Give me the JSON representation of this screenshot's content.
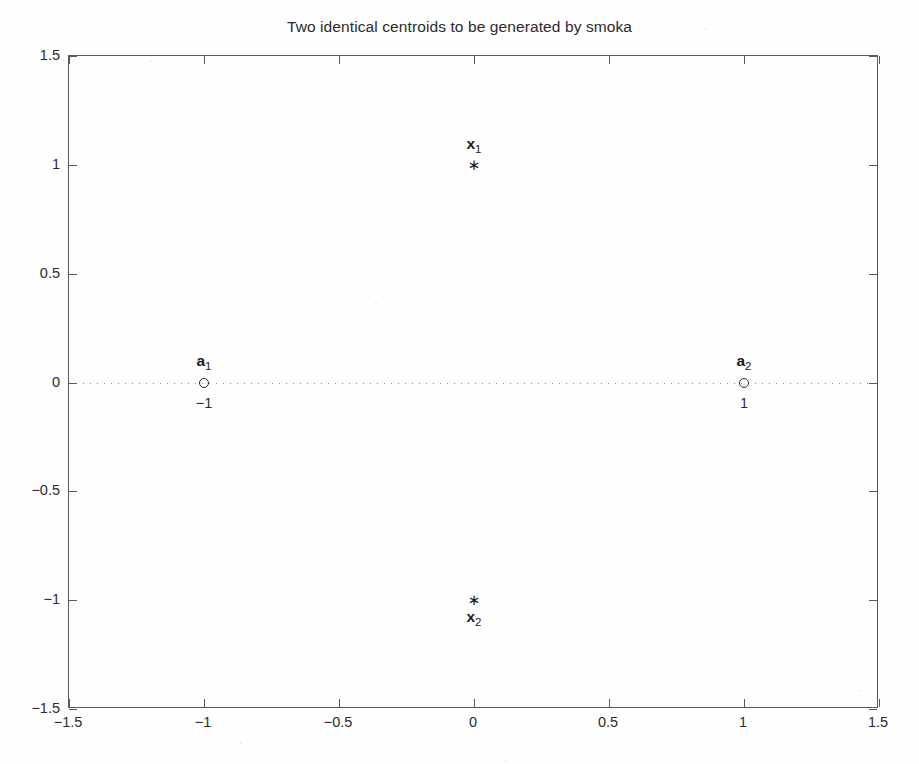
{
  "chart_data": {
    "type": "scatter",
    "title": "Two identical centroids to be generated by smoka",
    "xlabel": "",
    "ylabel": "",
    "xlim": [
      -1.5,
      1.5
    ],
    "ylim": [
      -1.5,
      1.5
    ],
    "grid": false,
    "legend": "none",
    "xticks": [
      -1.5,
      -1,
      -0.5,
      0,
      0.5,
      1,
      1.5
    ],
    "xticklabels": [
      "-1.5",
      "-1",
      "-0.5",
      "0",
      "0.5",
      "1",
      "1.5"
    ],
    "yticks": [
      -1.5,
      -1,
      -0.5,
      0,
      0.5,
      1,
      1.5
    ],
    "yticklabels": [
      "-1.5",
      "-1",
      "-0.5",
      "0",
      "0.5",
      "1",
      "1.5"
    ],
    "reference_lines": [
      {
        "name": "zero-horizontal",
        "orientation": "horizontal",
        "value": 0,
        "style": "dotted",
        "color": "#8d8d8d"
      }
    ],
    "series": [
      {
        "name": "data points",
        "marker": "star",
        "color": "#1f1f1f",
        "points": [
          {
            "id": "x1",
            "x": 0,
            "y": 1.0
          },
          {
            "id": "x2",
            "x": 0,
            "y": -1.0
          }
        ]
      },
      {
        "name": "centroids",
        "marker": "circle",
        "color": "#2b2b2b",
        "points": [
          {
            "id": "a1",
            "x": -1,
            "y": 0
          },
          {
            "id": "a2",
            "x": 1,
            "y": 0
          }
        ]
      }
    ],
    "annotations": [
      {
        "id": "label-x1",
        "symbol": "x",
        "subscript": "1",
        "x": 0,
        "y": 1.09,
        "target": "x1"
      },
      {
        "id": "label-x2",
        "symbol": "x",
        "subscript": "2",
        "x": 0,
        "y": -1.08,
        "target": "x2"
      },
      {
        "id": "label-a1",
        "symbol": "a",
        "subscript": "1",
        "x": -1,
        "y": 0.095,
        "target": "a1"
      },
      {
        "id": "label-a2",
        "symbol": "a",
        "subscript": "2",
        "x": 1,
        "y": 0.095,
        "target": "a2"
      },
      {
        "id": "value-a1",
        "text": "-1",
        "x": -1,
        "y": -0.095,
        "target": "a1"
      },
      {
        "id": "value-a2",
        "text": "1",
        "x": 1,
        "y": -0.095,
        "target": "a2"
      }
    ]
  },
  "colors": {
    "background": "#fefefe",
    "axis": "#595959",
    "text": "#1a1a1a",
    "marker": "#1f1f1f",
    "reference_line": "#8d8d8d"
  }
}
